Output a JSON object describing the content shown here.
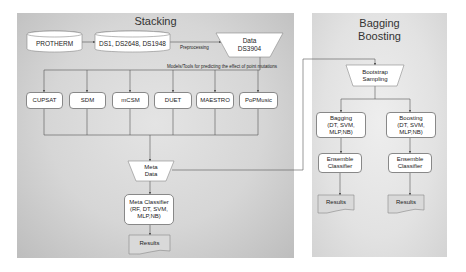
{
  "stacking_panel": {
    "title": "Stacking",
    "sources": {
      "protherm": "PROTHERM",
      "datasets": "DS1, DS2648, DS1948"
    },
    "preprocessing_label": "Preprocessing",
    "data_node": {
      "line1": "Data",
      "line2": "DS3904"
    },
    "tools_label": "Models/Tools  for predicting the effect of point mutations",
    "tools": [
      "CUPSAT",
      "SDM",
      "mCSM",
      "DUET",
      "MAESTRO",
      "PoPMusic"
    ],
    "meta_data": {
      "line1": "Meta",
      "line2": "Data"
    },
    "meta_classifier": {
      "line1": "Meta Classifier",
      "line2": "(RF, DT, SVM,",
      "line3": "MLP,NB)"
    },
    "results": "Results"
  },
  "bagging_panel": {
    "title_line1": "Bagging",
    "title_line2": "Boosting",
    "bootstrap": {
      "line1": "Bootstrap",
      "line2": "Sampling"
    },
    "bagging": {
      "line1": "Bagging",
      "line2": "(DT, SVM,",
      "line3": "MLP,NB)"
    },
    "boosting": {
      "line1": "Boosting",
      "line2": "(DT, SVM,",
      "line3": "MLP,NB)"
    },
    "ensemble_left": {
      "line1": "Ensemble",
      "line2": "Classifier"
    },
    "ensemble_right": {
      "line1": "Ensemble",
      "line2": "Classifier"
    },
    "results_left": "Results",
    "results_right": "Results"
  },
  "colors": {
    "panel_bg": "#d6d6d6",
    "node_fill": "#ffffff",
    "results_fill": "#d9d9d9",
    "line": "#555555"
  }
}
